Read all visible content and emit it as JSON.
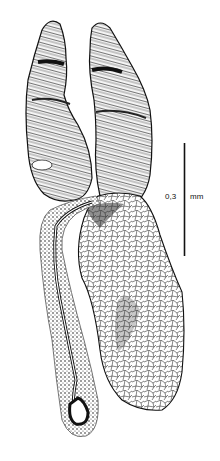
{
  "figure": {
    "type": "anatomical line drawing",
    "structures": [
      {
        "name": "left-lobe",
        "style": "dense hatched / striated"
      },
      {
        "name": "right-lobe",
        "style": "dense hatched / striated"
      },
      {
        "name": "large-body",
        "style": "reticulated cell network"
      },
      {
        "name": "duct-tail",
        "style": "stippled tube with lumen"
      }
    ],
    "ink_color": "#111111",
    "background": "#ffffff"
  },
  "scale_bar": {
    "value": "0,3",
    "unit": "mm"
  }
}
